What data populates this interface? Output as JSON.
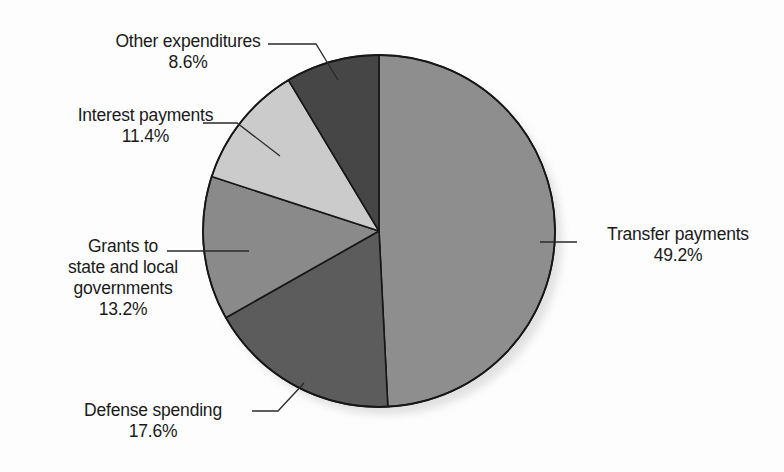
{
  "chart_data": {
    "type": "pie",
    "title": "",
    "subtitle": "",
    "xlabel": "",
    "ylabel": "",
    "legend_position": "callout-labels",
    "grid": false,
    "start_angle_deg": 0,
    "direction": "clockwise",
    "center": {
      "x": 379,
      "y": 231
    },
    "radius": 176,
    "categories": [
      "Transfer payments",
      "Defense spending",
      "Grants to state and local governments",
      "Interest payments",
      "Other expenditures"
    ],
    "values": [
      49.2,
      17.6,
      13.2,
      11.4,
      8.6
    ],
    "value_labels": [
      "49.2%",
      "17.6%",
      "13.2%",
      "11.4%",
      "8.6%"
    ],
    "units": "percent",
    "total": 100.0,
    "slices": [
      {
        "name": "Transfer payments",
        "value": 49.2,
        "value_label": "49.2%",
        "color": "#8e8e8e",
        "start_deg": 0,
        "end_deg": 177.12
      },
      {
        "name": "Defense spending",
        "value": 17.6,
        "value_label": "17.6%",
        "color": "#5c5c5c",
        "start_deg": 177.12,
        "end_deg": 240.48
      },
      {
        "name": "Grants to state and local governments",
        "value": 13.2,
        "value_label": "13.2%",
        "color": "#8a8a8a",
        "start_deg": 240.48,
        "end_deg": 288.0
      },
      {
        "name": "Interest payments",
        "value": 11.4,
        "value_label": "11.4%",
        "color": "#cbcbcb",
        "start_deg": 288.0,
        "end_deg": 329.04
      },
      {
        "name": "Other expenditures",
        "value": 8.6,
        "value_label": "8.6%",
        "color": "#464646",
        "start_deg": 329.04,
        "end_deg": 360.0
      }
    ]
  },
  "labels": {
    "other": {
      "name": "Other expenditures",
      "value": "8.6%"
    },
    "interest": {
      "name": "Interest payments",
      "value": "11.4%"
    },
    "grants": {
      "line1": "Grants to",
      "line2": "state and local",
      "line3": "governments",
      "value": "13.2%"
    },
    "defense": {
      "name": "Defense spending",
      "value": "17.6%"
    },
    "transfer": {
      "name": "Transfer payments",
      "value": "49.2%"
    }
  },
  "colors": {
    "background": "#fdfdfd",
    "outline": "#171717",
    "leader_line": "#2a2a2a",
    "text": "#1a1a1a",
    "shadow": "#d8d8d8"
  }
}
